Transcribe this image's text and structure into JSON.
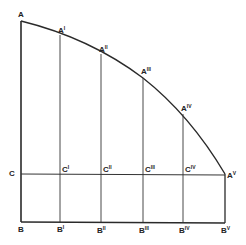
{
  "diagram": {
    "type": "geometric-subdivision",
    "stroke_color": "#2a2a2a",
    "background": "#ffffff",
    "points": {
      "A": {
        "label": "A",
        "sup": ""
      },
      "A1": {
        "label": "A",
        "sup": "I"
      },
      "A2": {
        "label": "A",
        "sup": "II"
      },
      "A3": {
        "label": "A",
        "sup": "III"
      },
      "A4": {
        "label": "A",
        "sup": "IV"
      },
      "A5": {
        "label": "A",
        "sup": "V"
      },
      "C": {
        "label": "C",
        "sup": ""
      },
      "C1": {
        "label": "C",
        "sup": "I"
      },
      "C2": {
        "label": "C",
        "sup": "II"
      },
      "C3": {
        "label": "C",
        "sup": "III"
      },
      "C4": {
        "label": "C",
        "sup": "IV"
      },
      "B": {
        "label": "B",
        "sup": ""
      },
      "B1": {
        "label": "B",
        "sup": "I"
      },
      "B2": {
        "label": "B",
        "sup": "II"
      },
      "B3": {
        "label": "B",
        "sup": "III"
      },
      "B4": {
        "label": "B",
        "sup": "IV"
      },
      "B5": {
        "label": "B",
        "sup": "V"
      }
    }
  }
}
